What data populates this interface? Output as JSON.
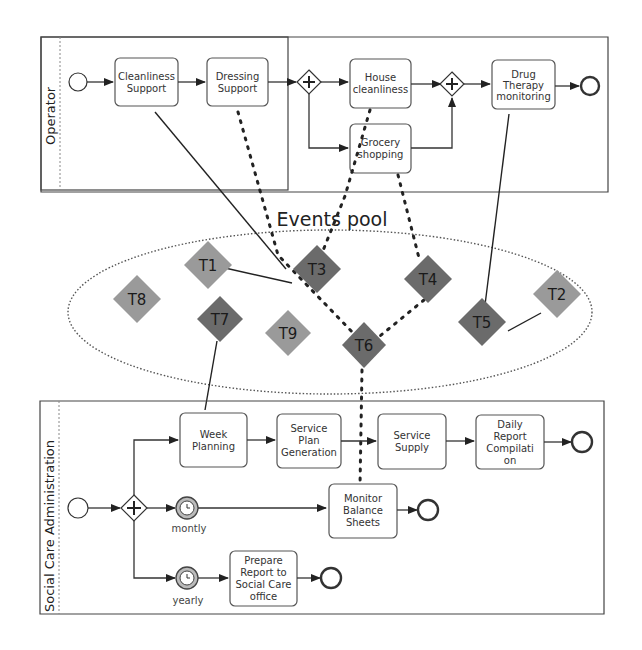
{
  "lanes": {
    "operator": {
      "label": "Operator"
    },
    "social": {
      "label": "Social Care Administration"
    }
  },
  "operator_tasks": [
    {
      "id": "cleanliness",
      "lines": [
        "Cleanliness",
        "Support"
      ]
    },
    {
      "id": "dressing",
      "lines": [
        "Dressing",
        "Support"
      ]
    },
    {
      "id": "house",
      "lines": [
        "House",
        "cleanliness"
      ]
    },
    {
      "id": "grocery",
      "lines": [
        "Grocery",
        "shopping"
      ]
    },
    {
      "id": "drug",
      "lines": [
        "Drug",
        "Therapy",
        "monitoring"
      ]
    }
  ],
  "social_tasks": [
    {
      "id": "week",
      "lines": [
        "Week",
        "Planning"
      ]
    },
    {
      "id": "spg",
      "lines": [
        "Service",
        "Plan",
        "Generation"
      ]
    },
    {
      "id": "supply",
      "lines": [
        "Service",
        "Supply"
      ]
    },
    {
      "id": "daily",
      "lines": [
        "Daily",
        "Report",
        "Compilati",
        "on"
      ]
    },
    {
      "id": "monitor",
      "lines": [
        "Monitor",
        "Balance",
        "Sheets"
      ]
    },
    {
      "id": "prepare",
      "lines": [
        "Prepare",
        "Report to",
        "Social Care",
        "office"
      ]
    }
  ],
  "timers": {
    "monthly": "montly",
    "yearly": "yearly"
  },
  "events_pool": {
    "label": "Events pool",
    "events": [
      {
        "id": "T1",
        "label": "T1",
        "shade": "light"
      },
      {
        "id": "T2",
        "label": "T2",
        "shade": "light"
      },
      {
        "id": "T3",
        "label": "T3",
        "shade": "dark"
      },
      {
        "id": "T4",
        "label": "T4",
        "shade": "dark"
      },
      {
        "id": "T5",
        "label": "T5",
        "shade": "dark"
      },
      {
        "id": "T6",
        "label": "T6",
        "shade": "dark"
      },
      {
        "id": "T7",
        "label": "T7",
        "shade": "dark"
      },
      {
        "id": "T8",
        "label": "T8",
        "shade": "light"
      },
      {
        "id": "T9",
        "label": "T9",
        "shade": "light"
      }
    ]
  },
  "colors": {
    "light_event": "#9a9a9a",
    "dark_event": "#6b6b6b",
    "line": "#333333"
  }
}
